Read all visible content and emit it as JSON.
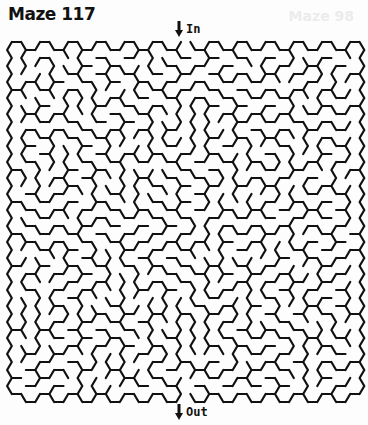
{
  "title": "Maze 117",
  "ghost_title": "Maze 98",
  "entrance": {
    "label": "In",
    "icon": "arrow-down-icon"
  },
  "exit": {
    "label": "Out",
    "icon": "arrow-down-icon"
  },
  "maze": {
    "grid": "hexagonal",
    "orientation": "flat-top",
    "columns": 25,
    "rows": 22,
    "stroke_color": "#111111",
    "background": "#fdfdfd",
    "seed": 117
  }
}
